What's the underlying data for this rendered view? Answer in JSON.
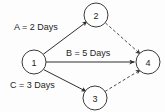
{
  "diagram": {
    "type": "activity-on-arrow-network",
    "background_color": "#fdfdfd",
    "stroke_color": "#2e2e2e",
    "dashed_stroke_color": "#4a4a4a",
    "text_color": "#1e1e1e",
    "nodes": [
      {
        "id": "1",
        "label": "1",
        "cx": 34,
        "cy": 62,
        "r": 12
      },
      {
        "id": "2",
        "label": "2",
        "cx": 96,
        "cy": 15,
        "r": 12
      },
      {
        "id": "3",
        "label": "3",
        "cx": 95,
        "cy": 98,
        "r": 12
      },
      {
        "id": "4",
        "label": "4",
        "cx": 148,
        "cy": 62,
        "r": 12
      }
    ],
    "edges": [
      {
        "id": "edge-1-2",
        "from": "1",
        "to": "2",
        "style": "solid",
        "label": "A = 2 Days"
      },
      {
        "id": "edge-1-4",
        "from": "1",
        "to": "4",
        "style": "solid",
        "label": "B = 5 Days"
      },
      {
        "id": "edge-1-3",
        "from": "1",
        "to": "3",
        "style": "solid",
        "label": "C = 3 Days"
      },
      {
        "id": "edge-2-4",
        "from": "2",
        "to": "4",
        "style": "dashed",
        "label": ""
      },
      {
        "id": "edge-3-4",
        "from": "3",
        "to": "4",
        "style": "dashed",
        "label": ""
      }
    ],
    "labels": {
      "activity_a": "A = 2 Days",
      "activity_b": "B = 5 Days",
      "activity_c": "C = 3 Days",
      "node_1": "1",
      "node_2": "2",
      "node_3": "3",
      "node_4": "4"
    }
  }
}
